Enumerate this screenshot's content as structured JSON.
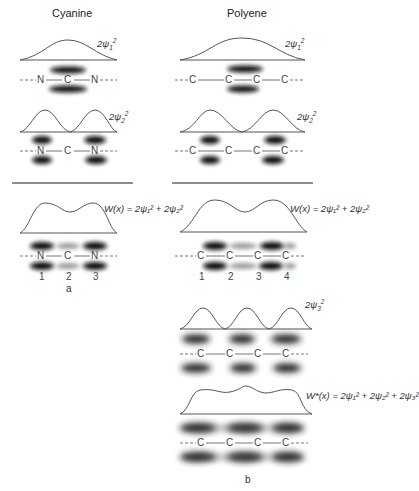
{
  "columns": {
    "left_title": "Cyanine",
    "right_title": "Polyene"
  },
  "labels": {
    "psi1": "2ψ",
    "psi2": "2ψ",
    "psi3": "2ψ",
    "psi1_sub": "1",
    "psi2_sub": "2",
    "psi3_sub": "3",
    "sq": "2",
    "w_cyanine": "W(x) = 2ψ₁² + 2ψ₂²",
    "w_polyene": "W(x) = 2ψ₁² + 2ψ₂²",
    "w_star": "W*(x) = 2ψ₁² + 2ψ₂² + 2ψ₃²"
  },
  "chains": {
    "cyanine": [
      "N",
      "C",
      "N"
    ],
    "polyene": [
      "C",
      "C",
      "C",
      "C"
    ]
  },
  "positions": {
    "cyanine": [
      "1",
      "2",
      "3"
    ],
    "polyene": [
      "1",
      "2",
      "3",
      "4"
    ]
  },
  "panels": {
    "a": "a",
    "b": "b"
  }
}
